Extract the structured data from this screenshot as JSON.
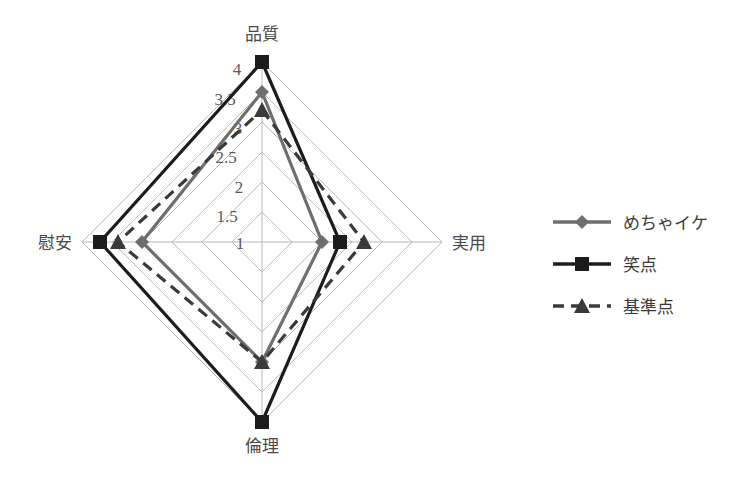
{
  "chart_data": {
    "type": "radar",
    "title": "",
    "categories": [
      "品質",
      "実用",
      "倫理",
      "慰安"
    ],
    "axis_order": [
      "top",
      "right",
      "bottom",
      "left"
    ],
    "rlim": [
      1,
      4
    ],
    "r_ticks": [
      "4",
      "3.5",
      "3",
      "2.5",
      "2",
      "1.5",
      "1"
    ],
    "r_tick_values": [
      4,
      3.5,
      3,
      2.5,
      2,
      1.5,
      1
    ],
    "grid": true,
    "legend_position": "right",
    "series": [
      {
        "name": "めちゃイケ",
        "values": [
          3.5,
          2.0,
          3.0,
          3.0
        ],
        "color": "#6e6e6e",
        "marker": "diamond",
        "dash": "solid"
      },
      {
        "name": "笑点",
        "values": [
          4.0,
          2.3,
          4.0,
          3.7
        ],
        "color": "#1c1c1c",
        "marker": "square",
        "dash": "solid"
      },
      {
        "name": "基準点",
        "values": [
          3.2,
          2.7,
          3.0,
          3.4
        ],
        "color": "#3a3a3a",
        "marker": "triangle",
        "dash": "dashed"
      }
    ]
  },
  "axes": {
    "top": "品質",
    "right": "実用",
    "bottom": "倫理",
    "left": "慰安"
  },
  "ticks": {
    "t4": "4",
    "t35": "3.5",
    "t3": "3",
    "t25": "2.5",
    "t2": "2",
    "t15": "1.5",
    "t1": "1"
  },
  "legend": {
    "items": [
      {
        "label": "めちゃイケ"
      },
      {
        "label": "笑点"
      },
      {
        "label": "基準点"
      }
    ]
  },
  "colors": {
    "series_1": "#6e6e6e",
    "series_2": "#1c1c1c",
    "series_3": "#3a3a3a",
    "grid": "#b9b9b9",
    "background": "#ffffff"
  }
}
